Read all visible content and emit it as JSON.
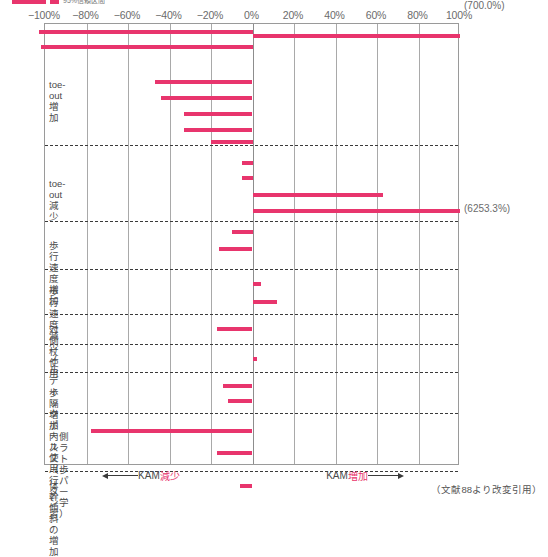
{
  "legend": {
    "swatch_color": "#e8356d",
    "label": "95%信頼区間",
    "cut_off": true
  },
  "credit": "（文献88より改変引用）",
  "axis_footer": {
    "left": {
      "prefix": "KAM",
      "highlight": "減少"
    },
    "right": {
      "prefix": "KAM",
      "highlight": "増加"
    }
  },
  "chart_data": {
    "type": "bar",
    "orientation": "horizontal",
    "title": "",
    "xlabel": "",
    "ylabel": "",
    "xlim": [
      -100,
      100
    ],
    "xticks": [
      -100,
      -80,
      -60,
      -40,
      -20,
      0,
      20,
      40,
      60,
      80,
      100
    ],
    "xticklabels": [
      "−100%",
      "−80%",
      "−60%",
      "−40%",
      "−20%",
      "0%",
      "20%",
      "40%",
      "60%",
      "80%",
      "100%"
    ],
    "grid": true,
    "bar_color": "#e8356d",
    "groups": [
      {
        "label": "toe-out増加",
        "bars": [
          {
            "start": -103,
            "end": 0,
            "clipped_left": true
          },
          {
            "start": -102,
            "end": 0,
            "clipped_left": true
          },
          {
            "start": -47,
            "end": 0
          },
          {
            "start": -44,
            "end": 0
          },
          {
            "start": -33,
            "end": 0
          },
          {
            "start": -33,
            "end": 0
          },
          {
            "start": -20,
            "end": 0
          },
          {
            "start": 0,
            "end": 100,
            "overflow_label": "(700.0%)"
          }
        ]
      },
      {
        "label": "toe-out減少",
        "bars": [
          {
            "start": -5,
            "end": 0
          },
          {
            "start": -5,
            "end": 0
          },
          {
            "start": 0,
            "end": 63
          },
          {
            "start": 0,
            "end": 100,
            "overflow_label": "(6253.3%)"
          }
        ]
      },
      {
        "label": "歩行速度増加",
        "bars": [
          {
            "start": -10,
            "end": 0
          },
          {
            "start": -16,
            "end": 0
          }
        ]
      },
      {
        "label": "歩行速度減少",
        "bars": [
          {
            "start": 0,
            "end": 4
          },
          {
            "start": 0,
            "end": 12
          }
        ]
      },
      {
        "label": "対側杖使用",
        "bars": [
          {
            "start": -17,
            "end": 0
          }
        ]
      },
      {
        "label": "ノルディックポール使用",
        "bars": [
          {
            "start": 0,
            "end": 2
          }
        ]
      },
      {
        "label": "歩隔増加",
        "bars": [
          {
            "start": -14,
            "end": 0
          },
          {
            "start": -12,
            "end": 0
          }
        ]
      },
      {
        "label": "内側スラスト\n（歩行パターン学習）",
        "bars": [
          {
            "start": -78,
            "end": 0
          },
          {
            "start": -17,
            "end": 0
          }
        ]
      },
      {
        "label": "体幹傾斜の増加",
        "bars": [
          {
            "start": -6,
            "end": 0
          }
        ]
      }
    ]
  }
}
